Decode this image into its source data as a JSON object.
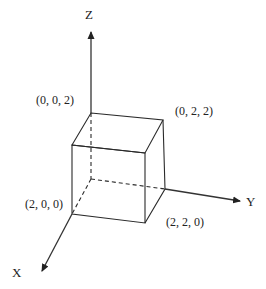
{
  "diagram": {
    "type": "3d-cube-coordinate-axes",
    "axes": {
      "x": {
        "label": "X"
      },
      "y": {
        "label": "Y"
      },
      "z": {
        "label": "Z"
      }
    },
    "vertex_labels": {
      "top_back_left": "(0, 0, 2)",
      "top_back_right": "(0, 2, 2)",
      "bottom_front_left": "(2, 0, 0)",
      "bottom_front_right": "(2, 2, 0)"
    },
    "colors": {
      "line": "#2a2a2a",
      "text": "#222222",
      "background": "#ffffff"
    }
  }
}
